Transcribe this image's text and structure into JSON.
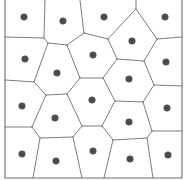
{
  "diagram": {
    "type": "voronoi",
    "width": 184,
    "height": 180,
    "colors": {
      "edge": "#6e6e6e",
      "site": "#4a4a4a",
      "background": "#ffffff"
    },
    "border": [
      [
        5,
        0
      ],
      [
        5,
        178
      ],
      [
        182,
        178
      ],
      [
        182,
        0
      ]
    ],
    "sites": [
      [
        24,
        17
      ],
      [
        63,
        21
      ],
      [
        104,
        17
      ],
      [
        165,
        17
      ],
      [
        132,
        41
      ],
      [
        25,
        59
      ],
      [
        93,
        55
      ],
      [
        57,
        73
      ],
      [
        166,
        62
      ],
      [
        129,
        79
      ],
      [
        22,
        106
      ],
      [
        92,
        100
      ],
      [
        55,
        118
      ],
      [
        167,
        108
      ],
      [
        129,
        122
      ],
      [
        22,
        154
      ],
      [
        56,
        161
      ],
      [
        93,
        151
      ],
      [
        130,
        159
      ],
      [
        168,
        155
      ]
    ],
    "edges": [
      [
        [
          45,
          0
        ],
        [
          44,
          38
        ]
      ],
      [
        [
          44,
          38
        ],
        [
          5,
          37
        ]
      ],
      [
        [
          44,
          38
        ],
        [
          48,
          43
        ]
      ],
      [
        [
          48,
          43
        ],
        [
          67,
          45
        ]
      ],
      [
        [
          67,
          45
        ],
        [
          84,
          33
        ]
      ],
      [
        [
          80,
          0
        ],
        [
          84,
          33
        ]
      ],
      [
        [
          84,
          33
        ],
        [
          108,
          39
        ]
      ],
      [
        [
          108,
          39
        ],
        [
          136,
          9
        ]
      ],
      [
        [
          136,
          9
        ],
        [
          136,
          0
        ]
      ],
      [
        [
          136,
          9
        ],
        [
          157,
          39
        ]
      ],
      [
        [
          157,
          39
        ],
        [
          182,
          37
        ]
      ],
      [
        [
          108,
          39
        ],
        [
          117,
          59
        ]
      ],
      [
        [
          117,
          59
        ],
        [
          144,
          61
        ]
      ],
      [
        [
          144,
          61
        ],
        [
          157,
          39
        ]
      ],
      [
        [
          48,
          43
        ],
        [
          34,
          82
        ]
      ],
      [
        [
          34,
          82
        ],
        [
          5,
          80
        ]
      ],
      [
        [
          34,
          82
        ],
        [
          46,
          95
        ]
      ],
      [
        [
          67,
          45
        ],
        [
          80,
          78
        ]
      ],
      [
        [
          80,
          78
        ],
        [
          103,
          78
        ]
      ],
      [
        [
          103,
          78
        ],
        [
          117,
          59
        ]
      ],
      [
        [
          80,
          78
        ],
        [
          67,
          94
        ]
      ],
      [
        [
          46,
          95
        ],
        [
          67,
          94
        ]
      ],
      [
        [
          144,
          61
        ],
        [
          154,
          85
        ]
      ],
      [
        [
          154,
          85
        ],
        [
          182,
          86
        ]
      ],
      [
        [
          103,
          78
        ],
        [
          115,
          101
        ]
      ],
      [
        [
          115,
          101
        ],
        [
          143,
          102
        ]
      ],
      [
        [
          143,
          102
        ],
        [
          154,
          85
        ]
      ],
      [
        [
          46,
          95
        ],
        [
          32,
          127
        ]
      ],
      [
        [
          32,
          127
        ],
        [
          5,
          127
        ]
      ],
      [
        [
          32,
          127
        ],
        [
          40,
          138
        ]
      ],
      [
        [
          67,
          94
        ],
        [
          82,
          126
        ]
      ],
      [
        [
          82,
          126
        ],
        [
          102,
          126
        ]
      ],
      [
        [
          102,
          126
        ],
        [
          115,
          101
        ]
      ],
      [
        [
          82,
          126
        ],
        [
          73,
          137
        ]
      ],
      [
        [
          40,
          138
        ],
        [
          73,
          137
        ]
      ],
      [
        [
          143,
          102
        ],
        [
          152,
          131
        ]
      ],
      [
        [
          152,
          131
        ],
        [
          182,
          131
        ]
      ],
      [
        [
          102,
          126
        ],
        [
          113,
          140
        ]
      ],
      [
        [
          113,
          140
        ],
        [
          147,
          138
        ]
      ],
      [
        [
          147,
          138
        ],
        [
          152,
          131
        ]
      ],
      [
        [
          40,
          138
        ],
        [
          33,
          178
        ]
      ],
      [
        [
          73,
          137
        ],
        [
          82,
          178
        ]
      ],
      [
        [
          113,
          140
        ],
        [
          104,
          178
        ]
      ],
      [
        [
          147,
          138
        ],
        [
          153,
          178
        ]
      ]
    ]
  }
}
